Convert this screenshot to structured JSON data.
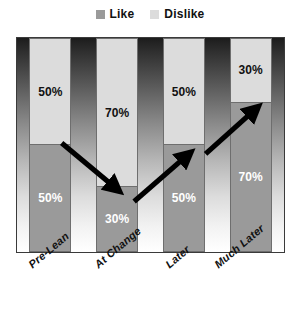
{
  "chart_data": {
    "type": "bar",
    "subtype": "stacked-100-percent",
    "title": "",
    "xlabel": "",
    "ylabel": "",
    "ylim": [
      0,
      100
    ],
    "grid": false,
    "legend_position": "top-center",
    "categories": [
      "Pre-Lean",
      "At Change",
      "Later",
      "Much Later"
    ],
    "series": [
      {
        "name": "Dislike",
        "color": "#dcdcdc",
        "stack_position": "top",
        "values": [
          50,
          70,
          50,
          30
        ],
        "value_labels": [
          "50%",
          "70%",
          "50%",
          "30%"
        ],
        "label_color": "#111111"
      },
      {
        "name": "Like",
        "color": "#9a9a9a",
        "stack_position": "bottom",
        "values": [
          50,
          30,
          50,
          70
        ],
        "value_labels": [
          "50%",
          "30%",
          "50%",
          "70%"
        ],
        "label_color": "#ffffff"
      }
    ],
    "annotations": [
      {
        "type": "arrow",
        "name": "trend-arrow-down",
        "direction": "down-right",
        "from_category": "Pre-Lean",
        "to_category": "At Change",
        "color": "#000000"
      },
      {
        "type": "arrow",
        "name": "trend-arrow-up-1",
        "direction": "up-right",
        "from_category": "At Change",
        "to_category": "Later",
        "color": "#000000"
      },
      {
        "type": "arrow",
        "name": "trend-arrow-up-2",
        "direction": "up-right",
        "from_category": "Later",
        "to_category": "Much Later",
        "color": "#000000"
      }
    ],
    "background": {
      "type": "vertical-gradient",
      "top_color": "#1c1c1c",
      "bottom_color": "#ffffff"
    }
  },
  "legend": {
    "items": [
      {
        "label": "Like",
        "color": "#9a9a9a"
      },
      {
        "label": "Dislike",
        "color": "#dcdcdc"
      }
    ]
  }
}
